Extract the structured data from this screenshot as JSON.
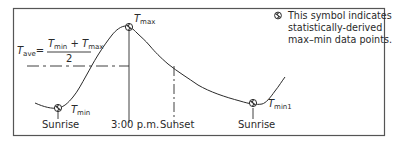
{
  "diagram": {
    "legend": {
      "symbol": "max-min-symbol",
      "lines": [
        "This symbol indicates",
        "statistically-derived",
        "max–min data points."
      ]
    },
    "formula": {
      "lhs_T": "T",
      "lhs_sub": "ave",
      "equals": "=",
      "num_T1": "T",
      "num_sub1": "min",
      "plus": "+",
      "num_T2": "T",
      "num_sub2": "max",
      "denominator": "2"
    },
    "points": {
      "tmin": {
        "T": "T",
        "sub": "min"
      },
      "tmax": {
        "T": "T",
        "sub": "max"
      },
      "tmin1": {
        "T": "T",
        "sub": "min1"
      }
    },
    "axis_labels": {
      "sunrise1": "Sunrise",
      "three_pm": "3:00 p.m.",
      "sunset": "Sunset",
      "sunrise2": "Sunrise"
    },
    "colors": {
      "line": "#2a2a2a",
      "border": "#555555"
    }
  }
}
